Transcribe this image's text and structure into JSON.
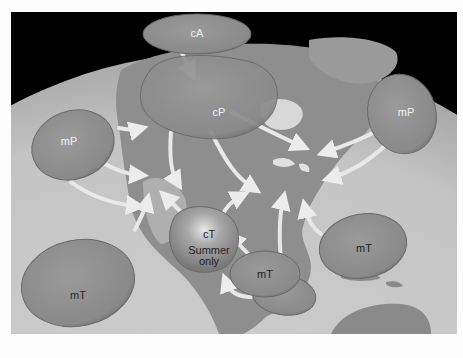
{
  "diagram": {
    "colors": {
      "space": "#000000",
      "ocean": "#cfcfcf",
      "land": "#8a8a8a",
      "air_mass": "#8f8f8f",
      "air_mass_edge": "#6a6a6a",
      "arrow": "#e6e6e6",
      "label_light": "#f2f2f2",
      "label_dark": "#222222",
      "border": "#fdfdfd"
    },
    "air_masses": [
      {
        "id": "cA-arctic",
        "label": "cA",
        "type": "continental arctic"
      },
      {
        "id": "cP-canada",
        "label": "cP",
        "type": "continental polar"
      },
      {
        "id": "mP-pacific",
        "label": "mP",
        "type": "maritime polar"
      },
      {
        "id": "mP-atlantic",
        "label": "mP",
        "type": "maritime polar"
      },
      {
        "id": "mT-pacific",
        "label": "mT",
        "type": "maritime tropical"
      },
      {
        "id": "cT-southwest",
        "label": "cT",
        "note_line1": "Summer",
        "note_line2": "only",
        "type": "continental tropical"
      },
      {
        "id": "mT-gulf",
        "label": "mT",
        "type": "maritime tropical"
      },
      {
        "id": "mT-atlantic",
        "label": "mT",
        "type": "maritime tropical"
      }
    ]
  }
}
